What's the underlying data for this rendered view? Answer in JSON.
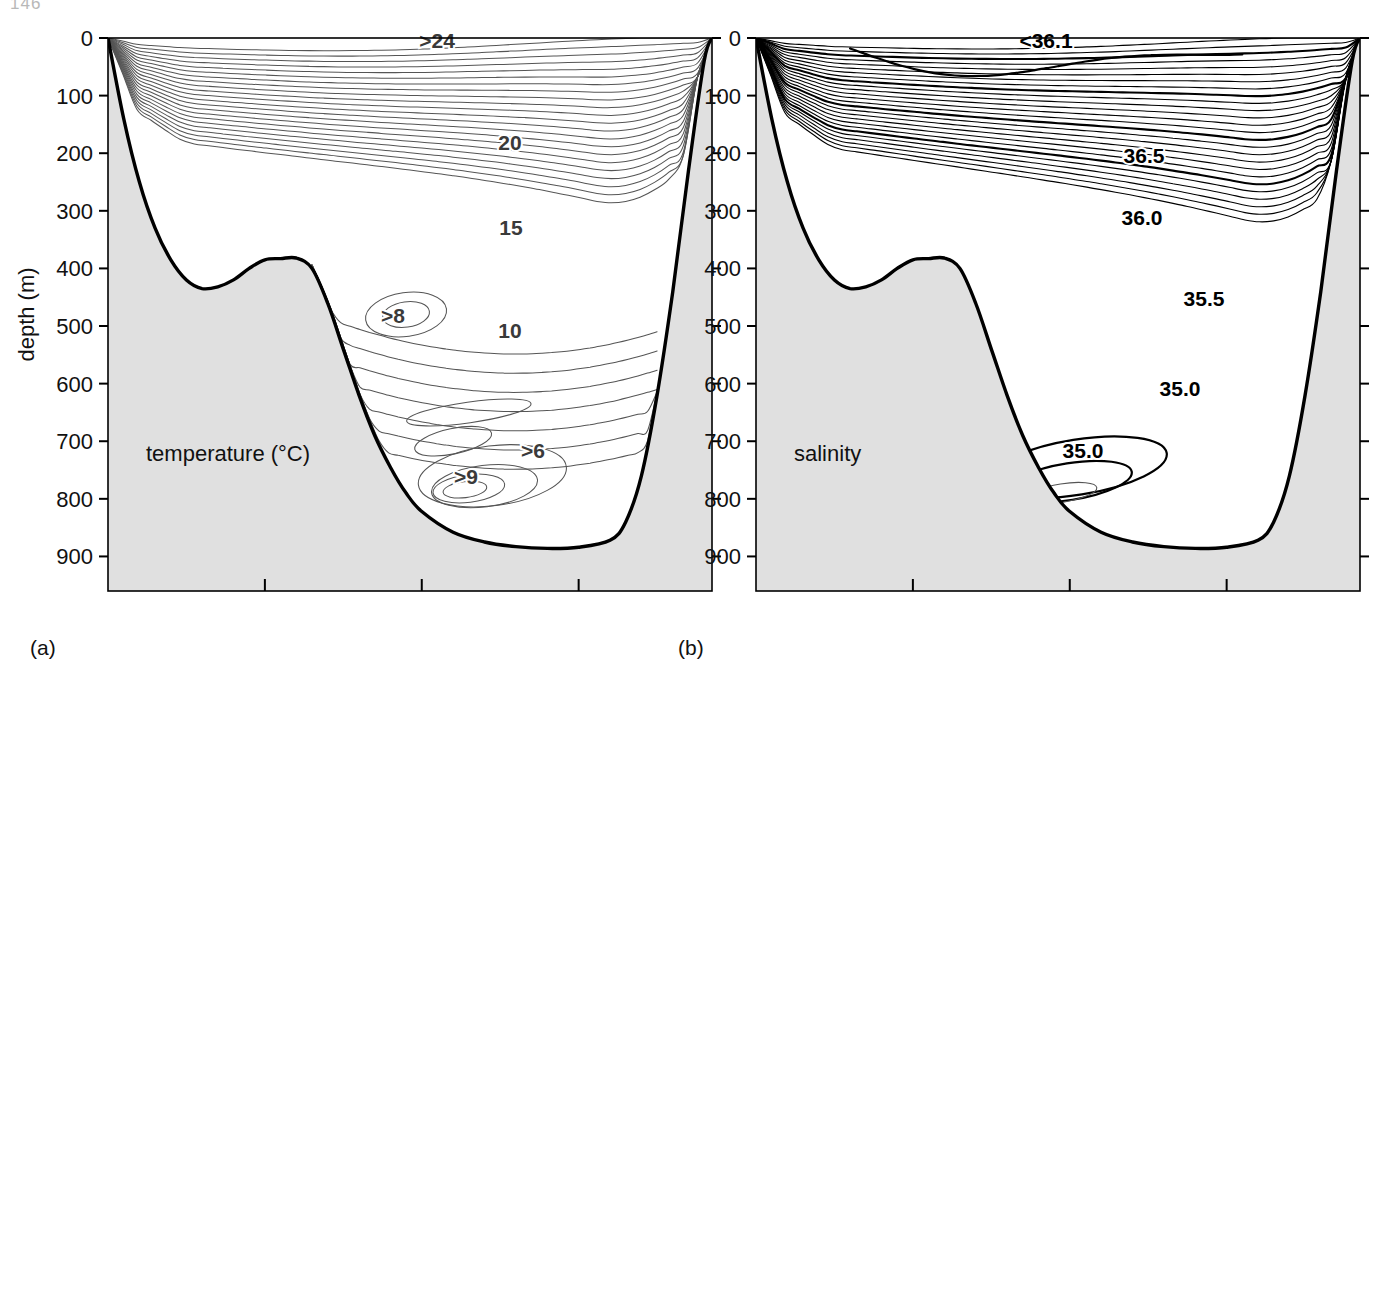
{
  "page": {
    "folio": "146"
  },
  "figure": {
    "axes": {
      "y": {
        "label": "depth (m)",
        "ticks": [
          0,
          100,
          200,
          300,
          400,
          500,
          600,
          700,
          800,
          900
        ],
        "min": 0,
        "max": 960,
        "unit": "m"
      },
      "x": {
        "label": "distance (km)",
        "ticks": [
          20,
          40,
          60
        ],
        "min": 0,
        "max": 77,
        "unit": "km"
      }
    },
    "panels": [
      {
        "key": "a",
        "letter": "(a)",
        "caption": "temperature (°C)",
        "show_y_axis_label": true,
        "show_x_axis": false,
        "contour_labels": [
          {
            "text": ">24",
            "x": 437,
            "y": 48
          },
          {
            "text": "20",
            "x": 510,
            "y": 150
          },
          {
            "text": "15",
            "x": 511,
            "y": 235
          },
          {
            "text": ">8",
            "x": 393,
            "y": 323
          },
          {
            "text": "10",
            "x": 510,
            "y": 338
          },
          {
            "text": ">6",
            "x": 533,
            "y": 458
          },
          {
            "text": ">9",
            "x": 466,
            "y": 484
          }
        ]
      },
      {
        "key": "b",
        "letter": "(b)",
        "caption": "salinity",
        "show_y_axis_label": false,
        "show_x_axis": false,
        "contour_labels": [
          {
            "text": "<36.1",
            "x": 1046,
            "y": 48,
            "bold": true
          },
          {
            "text": "36.5",
            "x": 1144,
            "y": 163,
            "bold": true
          },
          {
            "text": "36.0",
            "x": 1142,
            "y": 225,
            "bold": true
          },
          {
            "text": "35.5",
            "x": 1204,
            "y": 306,
            "bold": true
          },
          {
            "text": "35.0",
            "x": 1180,
            "y": 396,
            "bold": true
          },
          {
            "text": "35.0",
            "x": 1083,
            "y": 458,
            "bold": true
          }
        ]
      },
      {
        "key": "c",
        "letter": "(c)",
        "caption": "computed current (m s⁻¹)",
        "show_y_axis_label": true,
        "show_x_axis": true,
        "contour_labels": [
          {
            "text": ">1.6",
            "x": 401,
            "y": 682
          },
          {
            "text": "1.0",
            "x": 419,
            "y": 766,
            "bold": true
          },
          {
            "text": "0",
            "x": 433,
            "y": 1012
          }
        ]
      },
      {
        "key": "d",
        "letter": "(d)",
        "caption": "observed current (m s⁻¹)",
        "show_y_axis_label": false,
        "show_x_axis": true,
        "contour_labels": [
          {
            "text": ">1.6",
            "x": 963,
            "y": 682
          },
          {
            "text": "1.0",
            "x": 1053,
            "y": 766,
            "bold": true
          },
          {
            "text": "0",
            "x": 1117,
            "y": 1050
          }
        ]
      }
    ],
    "colors": {
      "seabed_fill": "#e0e0e0",
      "seabed_outline": "#000000",
      "contour_thin": "#555555",
      "contour_bold": "#000000",
      "frame": "#000000",
      "label_text": "#111111"
    }
  },
  "chart_data": {
    "type": "line",
    "xlabel": "distance (km)",
    "ylabel": "depth (m)",
    "xlim": [
      0,
      77
    ],
    "ylim": [
      960,
      0
    ],
    "grid": false,
    "legend": "none",
    "panels": [
      {
        "id": "a",
        "name": "temperature (°C)",
        "variable": "temperature",
        "unit": "°C",
        "labelled_contours": [
          24,
          20,
          15,
          10,
          9,
          8,
          6
        ],
        "annotations": [
          ">24",
          "20",
          "15",
          ">8",
          "10",
          ">6",
          ">9"
        ]
      },
      {
        "id": "b",
        "name": "salinity",
        "variable": "salinity",
        "unit": "",
        "labelled_contours": [
          36.1,
          36.5,
          36.0,
          35.5,
          35.0
        ],
        "annotations": [
          "<36.1",
          "36.5",
          "36.0",
          "35.5",
          "35.0",
          "35.0"
        ]
      },
      {
        "id": "c",
        "name": "computed current (m s⁻¹)",
        "variable": "computed current",
        "unit": "m s^-1",
        "labelled_contours": [
          1.6,
          1.0,
          0
        ],
        "annotations": [
          ">1.6",
          "1.0",
          "0"
        ]
      },
      {
        "id": "d",
        "name": "observed current (m s⁻¹)",
        "variable": "observed current",
        "unit": "m s^-1",
        "labelled_contours": [
          1.6,
          1.0,
          0
        ],
        "annotations": [
          ">1.6",
          "1.0",
          "0"
        ]
      }
    ],
    "seafloor_profile": {
      "distance_km": [
        0,
        2,
        4,
        6,
        8,
        10,
        12,
        14,
        16,
        18,
        20,
        22,
        24,
        26,
        28,
        30,
        32,
        34,
        36,
        38,
        40,
        44,
        48,
        52,
        56,
        60,
        64,
        66,
        68,
        70,
        72,
        74,
        76,
        77
      ],
      "depth_m": [
        0,
        140,
        250,
        330,
        385,
        420,
        435,
        432,
        420,
        400,
        385,
        383,
        382,
        400,
        460,
        540,
        620,
        690,
        745,
        790,
        822,
        858,
        875,
        883,
        886,
        884,
        872,
        840,
        760,
        620,
        440,
        230,
        40,
        0
      ]
    }
  }
}
